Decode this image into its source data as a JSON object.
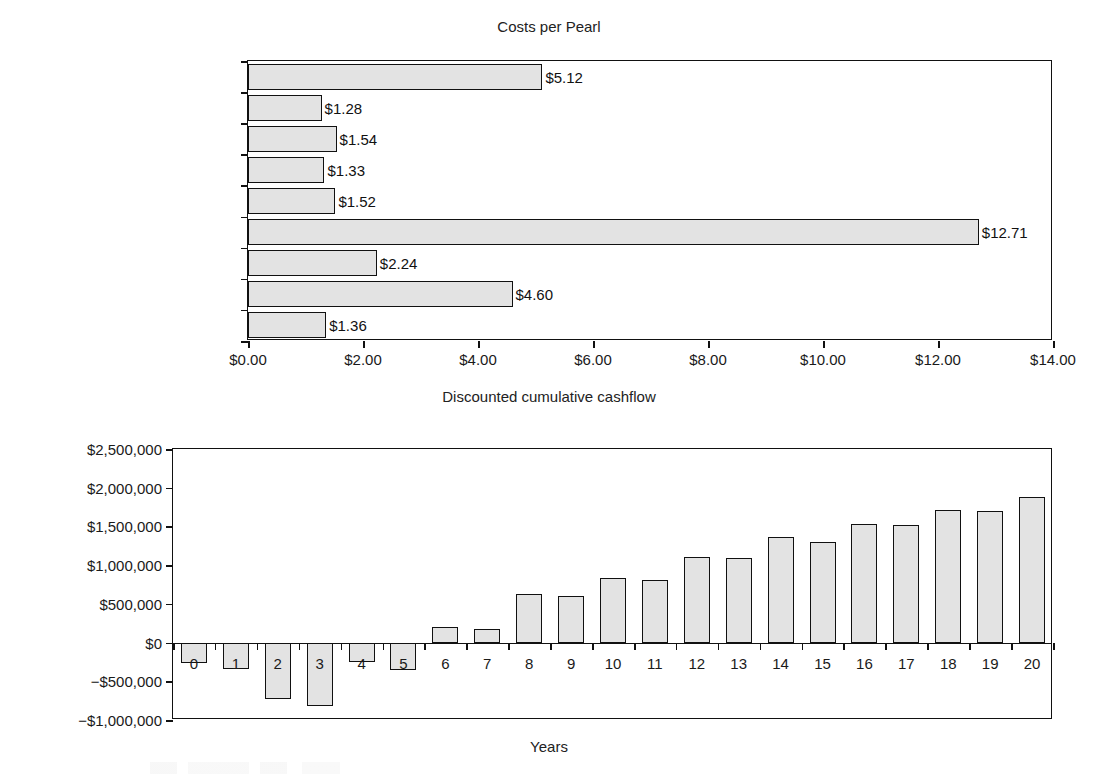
{
  "chart_data": [
    {
      "type": "bar",
      "orientation": "horizontal",
      "title": "Costs per Pearl",
      "xlabel": "",
      "ylabel": "",
      "xlim": [
        0,
        14
      ],
      "xtick_labels": [
        "$0.00",
        "$2.00",
        "$4.00",
        "$6.00",
        "$8.00",
        "$10.00",
        "$12.00",
        "$14.00"
      ],
      "xticks": [
        0,
        2,
        4,
        6,
        8,
        10,
        12,
        14
      ],
      "grid": false,
      "legend": "none",
      "categories": [
        "Capital",
        "Other operating",
        "Marketing",
        "Repairs and maintenance",
        "Fuel and energy",
        "Technicians",
        "Farm labour",
        "Nuclei",
        "Spat"
      ],
      "values": [
        5.12,
        1.28,
        1.54,
        1.33,
        1.52,
        12.71,
        2.24,
        4.6,
        1.36
      ],
      "data_labels": [
        "$5.12",
        "$1.28",
        "$1.54",
        "$1.33",
        "$1.52",
        "$12.71",
        "$2.24",
        "$4.60",
        "$1.36"
      ],
      "bar_fill": "#e3e3e3",
      "bar_edge": "#111111"
    },
    {
      "type": "bar",
      "orientation": "vertical",
      "title": "Discounted cumulative cashflow",
      "xlabel": "Years",
      "ylabel": "",
      "ylim": [
        -1000000,
        2500000
      ],
      "ytick_labels": [
        "$2,500,000",
        "$2,000,000",
        "$1,500,000",
        "$1,000,000",
        "$500,000",
        "$0",
        "−$500,000",
        "−$1,000,000"
      ],
      "yticks": [
        2500000,
        2000000,
        1500000,
        1000000,
        500000,
        0,
        -500000,
        -1000000
      ],
      "grid": false,
      "legend": "none",
      "categories": [
        "0",
        "1",
        "2",
        "3",
        "4",
        "5",
        "6",
        "7",
        "8",
        "9",
        "10",
        "11",
        "12",
        "13",
        "14",
        "15",
        "16",
        "17",
        "18",
        "19",
        "20"
      ],
      "values": [
        -270000,
        -345000,
        -730000,
        -820000,
        -250000,
        -350000,
        195000,
        175000,
        625000,
        600000,
        830000,
        810000,
        1110000,
        1095000,
        1365000,
        1305000,
        1530000,
        1520000,
        1710000,
        1700000,
        1880000
      ],
      "bar_fill": "#e3e3e3",
      "bar_edge": "#111111"
    }
  ]
}
